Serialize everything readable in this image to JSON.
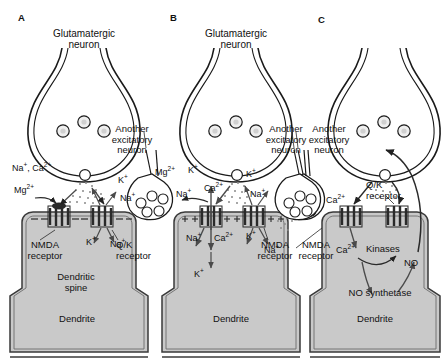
{
  "figure": {
    "colors": {
      "cytoplasm_fill": "#c9c9c9",
      "membrane_line": "#3a3a3a",
      "outline": "#1a1a1a",
      "vesicle_fill": "#e8e8e8",
      "background": "#ffffff"
    }
  },
  "panels": [
    {
      "id": "A",
      "letter": "A",
      "presynaptic_label": "Glutamatergic\nneuron",
      "presynaptic_line1": "Glutamatergic",
      "presynaptic_line2": "neuron",
      "another_neuron_line1": "Another",
      "another_neuron_line2": "excitatory",
      "another_neuron_line3": "neuron",
      "nmda_line1": "NMDA",
      "nmda_line2": "receptor",
      "qk_line1": "Q/K",
      "qk_line2": "receptor",
      "spine_line1": "Dendritic",
      "spine_line2": "spine",
      "dendrite_label": "Dendrite",
      "membrane_charge": "−",
      "ions": [
        {
          "text": "Na⁺, Ca²⁺",
          "role": "permeant-ions-blocked"
        },
        {
          "text": "Mg²⁺",
          "role": "channel-block"
        },
        {
          "text": "K⁺",
          "role": "efflux"
        },
        {
          "text": "Na⁺",
          "role": "influx-outside"
        },
        {
          "text": "K⁺",
          "role": "inside-efflux"
        },
        {
          "text": "Na⁺",
          "role": "inside-influx"
        }
      ]
    },
    {
      "id": "B",
      "letter": "B",
      "presynaptic_line1": "Glutamatergic",
      "presynaptic_line2": "neuron",
      "another_neuron_line1": "Another",
      "another_neuron_line2": "excitatory",
      "another_neuron_line3": "neuron",
      "nmda_line1": "NMDA",
      "nmda_line2": "receptor",
      "dendrite_label": "Dendrite",
      "membrane_charge": "+",
      "ions": [
        {
          "text": "Mg²⁺",
          "role": "expelled-block"
        },
        {
          "text": "K⁺",
          "role": "efflux-outside"
        },
        {
          "text": "Na⁺",
          "role": "outside-left"
        },
        {
          "text": "Ca²⁺",
          "role": "influx-outside"
        },
        {
          "text": "K⁺",
          "role": "qk-efflux-outside"
        },
        {
          "text": "Na⁺",
          "role": "qk-influx-outside"
        },
        {
          "text": "Na⁺",
          "role": "inside-nmda"
        },
        {
          "text": "Ca²⁺",
          "role": "inside-nmda-ca"
        },
        {
          "text": "K⁺",
          "role": "inside-qk-k"
        },
        {
          "text": "Na⁺",
          "role": "inside-qk-na"
        },
        {
          "text": "K⁺",
          "role": "inside-lower"
        }
      ]
    },
    {
      "id": "C",
      "letter": "C",
      "another_neuron_line1": "Another",
      "another_neuron_line2": "excitatory",
      "another_neuron_line3": "neuron",
      "nmda_line1": "NMDA",
      "nmda_line2": "receptor",
      "qk_line1": "Q/K",
      "qk_line2": "receptor",
      "dendrite_label": "Dendrite",
      "ions": [
        {
          "text": "Ca²⁺",
          "role": "influx-outside"
        },
        {
          "text": "Ca²⁺",
          "role": "inside-calcium"
        }
      ],
      "molecules": [
        {
          "text": "Kinases",
          "role": "signalling-enzyme"
        },
        {
          "text": "NO",
          "role": "nitric-oxide-messenger"
        },
        {
          "text": "NO synthetase",
          "role": "enzyme"
        }
      ]
    }
  ]
}
